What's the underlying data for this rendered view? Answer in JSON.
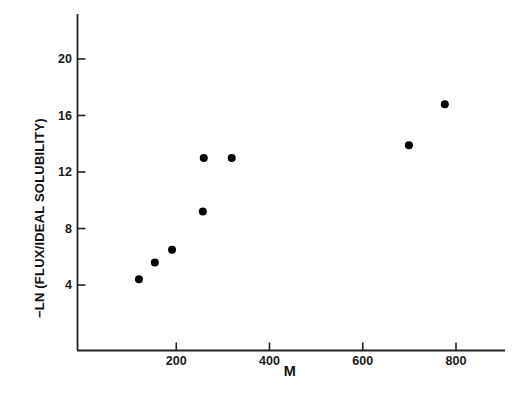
{
  "chart_data": {
    "type": "scatter",
    "title": "",
    "xlabel": "M",
    "ylabel": "−LN (FLUX/IDEAL SOLUBILITY)",
    "xlim": [
      0,
      905
    ],
    "ylim": [
      0,
      22
    ],
    "grid": false,
    "legend": null,
    "marker": {
      "shape": "circle",
      "color": "#000000",
      "size": 8
    },
    "xticks": [
      200,
      400,
      600,
      800
    ],
    "xtick_labels": [
      "200",
      "400",
      "600",
      "800"
    ],
    "yticks": [
      4,
      8,
      12,
      16,
      20
    ],
    "ytick_labels": [
      "4",
      "8",
      "12",
      "16",
      "20"
    ],
    "points": [
      {
        "x": 120,
        "y": 4.4
      },
      {
        "x": 154,
        "y": 5.6
      },
      {
        "x": 191,
        "y": 6.5
      },
      {
        "x": 257,
        "y": 9.2
      },
      {
        "x": 259,
        "y": 13.0
      },
      {
        "x": 319,
        "y": 13.0
      },
      {
        "x": 699,
        "y": 13.9
      },
      {
        "x": 776,
        "y": 16.8
      }
    ],
    "series": [
      {
        "name": "flux data",
        "x": [
          120,
          154,
          191,
          257,
          259,
          319,
          699,
          776
        ],
        "values": [
          4.4,
          5.6,
          6.5,
          9.2,
          13.0,
          13.0,
          13.9,
          16.8
        ]
      }
    ],
    "axis_color": "#222222",
    "background_color": "#ffffff"
  }
}
